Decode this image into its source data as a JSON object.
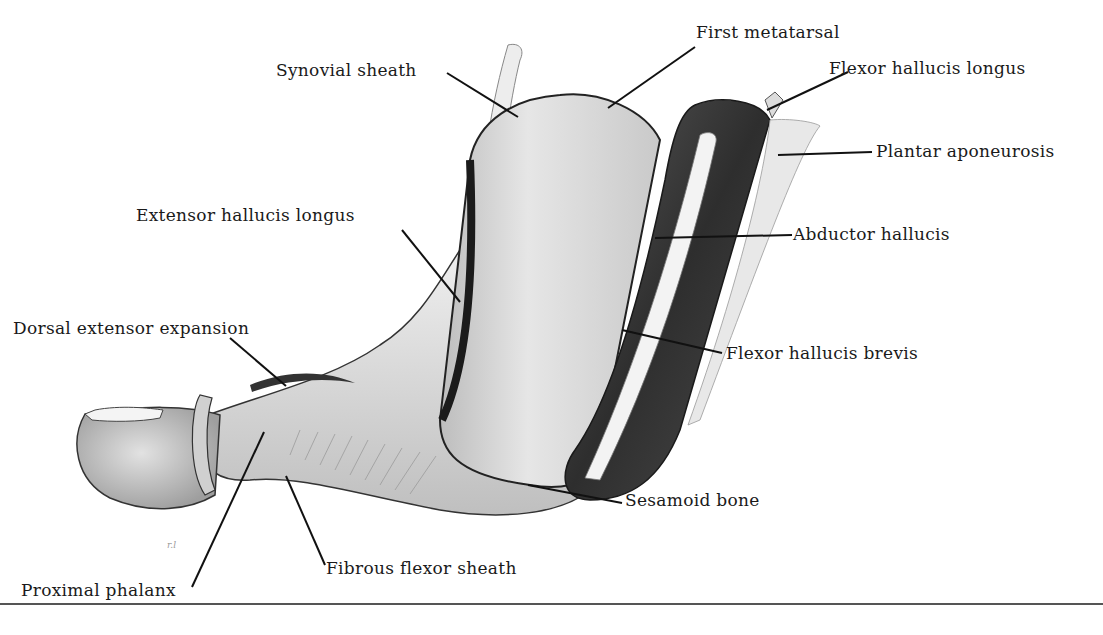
{
  "figure": {
    "colors": {
      "background": "#ffffff",
      "text": "#1a1a1a",
      "leader": "#111111",
      "muscle": "#3c3c3c",
      "bone": "#dcdcdc",
      "tendon": "#f2f2f2"
    },
    "labels": {
      "synovial_sheath": "Synovial sheath",
      "first_metatarsal": "First metatarsal",
      "flexor_hallucis_longus": "Flexor hallucis longus",
      "plantar_aponeurosis": "Plantar aponeurosis",
      "extensor_hallucis_longus": "Extensor hallucis longus",
      "abductor_hallucis": "Abductor hallucis",
      "dorsal_extensor_expansion": "Dorsal extensor expansion",
      "flexor_hallucis_brevis": "Flexor hallucis brevis",
      "sesamoid_bone": "Sesamoid bone",
      "fibrous_flexor_sheath": "Fibrous flexor sheath",
      "proximal_phalanx": "Proximal phalanx"
    },
    "signature": "r.l"
  }
}
